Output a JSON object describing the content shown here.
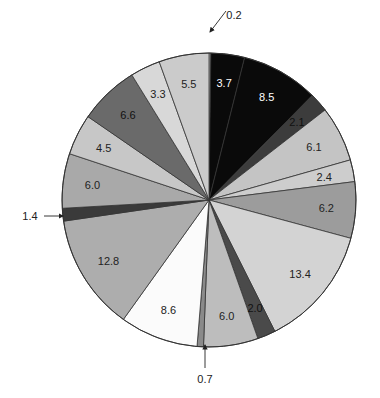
{
  "chart_data": {
    "type": "pie",
    "title": "",
    "start_angle_deg": 0,
    "direction": "clockwise",
    "center": [
      209,
      200
    ],
    "radius": 147,
    "slices": [
      {
        "value": 0.2,
        "label": "0.2",
        "color": "#c8c8c8",
        "label_mode": "external",
        "label_color": "#222222"
      },
      {
        "value": 3.7,
        "label": "3.7",
        "color": "#0a0a0a",
        "label_mode": "inside",
        "label_color": "#ffffff"
      },
      {
        "value": 8.5,
        "label": "8.5",
        "color": "#0a0a0a",
        "label_mode": "inside",
        "label_color": "#ffffff"
      },
      {
        "value": 2.1,
        "label": "2.1",
        "color": "#3c3c3c",
        "label_mode": "inside",
        "label_color": "#111111"
      },
      {
        "value": 6.1,
        "label": "6.1",
        "color": "#c4c4c4",
        "label_mode": "inside",
        "label_color": "#222222"
      },
      {
        "value": 2.4,
        "label": "2.4",
        "color": "#cdcdcd",
        "label_mode": "inside",
        "label_color": "#222222"
      },
      {
        "value": 6.2,
        "label": "6.2",
        "color": "#9c9c9c",
        "label_mode": "inside",
        "label_color": "#222222"
      },
      {
        "value": 13.4,
        "label": "13.4",
        "color": "#d3d3d3",
        "label_mode": "inside",
        "label_color": "#222222"
      },
      {
        "value": 2.0,
        "label": "2.0",
        "color": "#4a4a4a",
        "label_mode": "inside",
        "label_color": "#111111"
      },
      {
        "value": 6.0,
        "label": "6.0",
        "color": "#bdbdbd",
        "label_mode": "inside",
        "label_color": "#222222"
      },
      {
        "value": 0.7,
        "label": "0.7",
        "color": "#8a8a8a",
        "label_mode": "external",
        "label_color": "#222222"
      },
      {
        "value": 8.6,
        "label": "8.6",
        "color": "#fbfbfb",
        "label_mode": "inside",
        "label_color": "#222222"
      },
      {
        "value": 12.8,
        "label": "12.8",
        "color": "#adadad",
        "label_mode": "inside",
        "label_color": "#222222"
      },
      {
        "value": 1.4,
        "label": "1.4",
        "color": "#3a3a3a",
        "label_mode": "external",
        "label_color": "#222222"
      },
      {
        "value": 6.0,
        "label": "6.0",
        "color": "#a9a9a9",
        "label_mode": "inside",
        "label_color": "#222222"
      },
      {
        "value": 4.5,
        "label": "4.5",
        "color": "#c7c7c7",
        "label_mode": "inside",
        "label_color": "#222222"
      },
      {
        "value": 6.6,
        "label": "6.6",
        "color": "#6a6a6a",
        "label_mode": "inside",
        "label_color": "#111111"
      },
      {
        "value": 3.3,
        "label": "3.3",
        "color": "#d8d8d8",
        "label_mode": "inside",
        "label_color": "#222222"
      },
      {
        "value": 5.5,
        "label": "5.5",
        "color": "#cbcbcb",
        "label_mode": "inside",
        "label_color": "#222222"
      }
    ],
    "total": 100.0,
    "legend": "none",
    "external_labels": [
      {
        "label": "0.2",
        "text_pos": [
          234,
          15
        ],
        "arrow_from": [
          226,
          11
        ],
        "arrow_to": [
          210,
          32
        ]
      },
      {
        "label": "0.7",
        "text_pos": [
          205,
          379
        ],
        "arrow_from": [
          205,
          368
        ],
        "arrow_to": [
          205,
          345
        ]
      },
      {
        "label": "1.4",
        "text_pos": [
          30,
          216
        ],
        "arrow_from": [
          44,
          216
        ],
        "arrow_to": [
          63,
          216
        ]
      }
    ],
    "outline_color": "#333333"
  }
}
